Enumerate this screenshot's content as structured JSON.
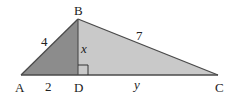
{
  "diagram": {
    "type": "right-triangle-with-altitude",
    "colors": {
      "left_fill": "#8c8c8c",
      "right_fill": "#c9c9c9",
      "stroke": "#4a4a4a",
      "text": "#222222"
    },
    "vertices": {
      "A": {
        "label": "A"
      },
      "B": {
        "label": "B"
      },
      "C": {
        "label": "C"
      },
      "D": {
        "label": "D"
      }
    },
    "segments": {
      "AB": {
        "label": "4"
      },
      "BC": {
        "label": "7"
      },
      "BD": {
        "label": "x"
      },
      "AD": {
        "label": "2"
      },
      "DC": {
        "label": "y"
      }
    },
    "right_angle_at": "D"
  }
}
